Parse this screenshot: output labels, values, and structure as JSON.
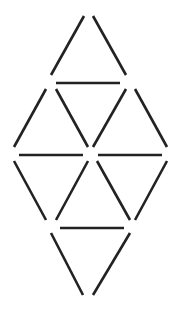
{
  "diagram": {
    "type": "matchstick-triangles",
    "stick_color": "#222222",
    "background": "#ffffff",
    "stick_width": 2.6,
    "sticks": [
      {
        "x1": 84,
        "y1": 16,
        "x2": 51,
        "y2": 75
      },
      {
        "x1": 93,
        "y1": 16,
        "x2": 126,
        "y2": 75
      },
      {
        "x1": 56,
        "y1": 83,
        "x2": 120,
        "y2": 83
      },
      {
        "x1": 46,
        "y1": 89,
        "x2": 14,
        "y2": 147
      },
      {
        "x1": 56,
        "y1": 89,
        "x2": 88,
        "y2": 147
      },
      {
        "x1": 126,
        "y1": 89,
        "x2": 93,
        "y2": 147
      },
      {
        "x1": 135,
        "y1": 89,
        "x2": 167,
        "y2": 147
      },
      {
        "x1": 19,
        "y1": 155,
        "x2": 83,
        "y2": 155
      },
      {
        "x1": 98,
        "y1": 155,
        "x2": 162,
        "y2": 155
      },
      {
        "x1": 14,
        "y1": 161,
        "x2": 46,
        "y2": 220
      },
      {
        "x1": 88,
        "y1": 161,
        "x2": 56,
        "y2": 220
      },
      {
        "x1": 97,
        "y1": 161,
        "x2": 130,
        "y2": 220
      },
      {
        "x1": 167,
        "y1": 161,
        "x2": 135,
        "y2": 220
      },
      {
        "x1": 60,
        "y1": 228,
        "x2": 124,
        "y2": 228
      },
      {
        "x1": 51,
        "y1": 233,
        "x2": 83,
        "y2": 295
      },
      {
        "x1": 130,
        "y1": 233,
        "x2": 93,
        "y2": 295
      }
    ]
  }
}
